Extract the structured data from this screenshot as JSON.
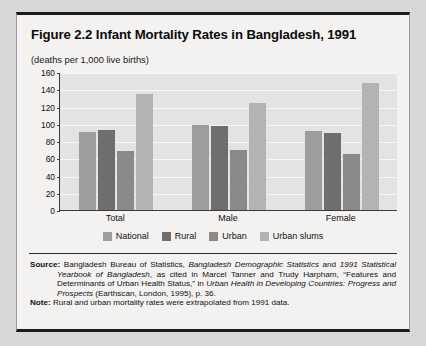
{
  "figure": {
    "title": "Figure 2.2  Infant Mortality Rates in Bangladesh, 1991",
    "units": "(deaths per 1,000 live births)"
  },
  "chart_data": {
    "type": "bar",
    "title": "Figure 2.2  Infant Mortality Rates in Bangladesh, 1991",
    "xlabel": "",
    "ylabel": "(deaths per 1,000 live births)",
    "ylim": [
      0,
      160
    ],
    "ytick_step": 20,
    "yticks": [
      "160",
      "140",
      "120",
      "100",
      "80",
      "60",
      "40",
      "20",
      "0"
    ],
    "grid": true,
    "legend_position": "bottom-center",
    "categories": [
      "Total",
      "Male",
      "Female"
    ],
    "series": [
      {
        "name": "National",
        "color": "#9d9d9b",
        "values": [
          90,
          98,
          92
        ]
      },
      {
        "name": "Rural",
        "color": "#6e6e6c",
        "values": [
          93,
          97,
          89
        ]
      },
      {
        "name": "Urban",
        "color": "#8a8a88",
        "values": [
          68,
          70,
          65
        ]
      },
      {
        "name": "Urban slums",
        "color": "#b3b3b1",
        "values": [
          134,
          124,
          147
        ]
      }
    ]
  },
  "footnotes": {
    "source_label": "Source:",
    "source_part_1": " Bangladesh Bureau of Statistics, ",
    "source_italic_1": "Bangladesh Demographic Statistics",
    "source_part_2": " and ",
    "source_italic_2": "1991 Statistical Yearbook of Bangladesh",
    "source_part_3": ", as cited in Marcel Tanner and Trudy Harpham, “Features and Determinants of Urban Health Status,” in ",
    "source_italic_3": "Urban Health in Developing Countries: Progress and Prospects",
    "source_part_4": " (Earthscan, London, 1995), p. 36.",
    "note_label": "Note:",
    "note_text": " Rural and urban mortality rates were extrapolated from 1991 data."
  }
}
